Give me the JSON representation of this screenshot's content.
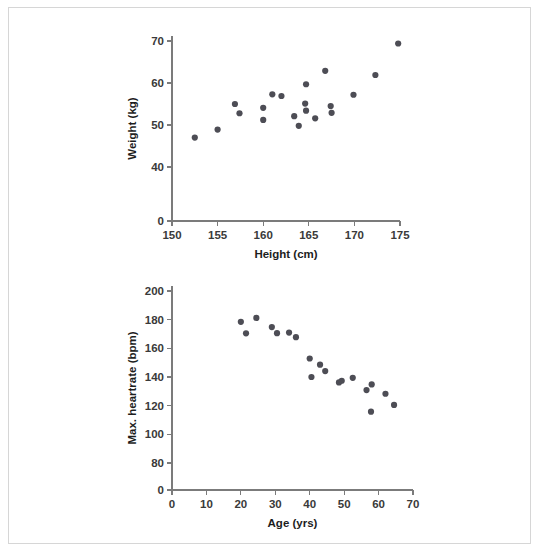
{
  "page": {
    "background": "#ffffff",
    "frame_color": "#d6d6d6",
    "point_color": "#4d4d55",
    "axis_color": "#7b7b7b"
  },
  "chart_data": [
    {
      "id": "height-weight-scatter",
      "type": "scatter",
      "title": "",
      "xlabel": "Height (cm)",
      "ylabel": "Weight (kg)",
      "xlim": [
        150,
        175
      ],
      "ylim": [
        35,
        72
      ],
      "xticks": [
        150,
        155,
        160,
        165,
        170,
        175
      ],
      "yticks": [
        0,
        40,
        50,
        60,
        70
      ],
      "y_axis_broken": true,
      "grid": false,
      "legend": "none",
      "points": [
        {
          "x": 152.5,
          "y": 47.0
        },
        {
          "x": 155.0,
          "y": 48.9
        },
        {
          "x": 156.9,
          "y": 55.0
        },
        {
          "x": 157.4,
          "y": 52.8
        },
        {
          "x": 160.0,
          "y": 54.1
        },
        {
          "x": 160.0,
          "y": 51.2
        },
        {
          "x": 161.0,
          "y": 57.3
        },
        {
          "x": 162.0,
          "y": 56.9
        },
        {
          "x": 163.4,
          "y": 52.1
        },
        {
          "x": 163.9,
          "y": 49.8
        },
        {
          "x": 164.7,
          "y": 59.7
        },
        {
          "x": 164.6,
          "y": 55.1
        },
        {
          "x": 164.7,
          "y": 53.4
        },
        {
          "x": 165.7,
          "y": 51.6
        },
        {
          "x": 166.8,
          "y": 62.9
        },
        {
          "x": 167.4,
          "y": 54.5
        },
        {
          "x": 167.5,
          "y": 52.9
        },
        {
          "x": 169.9,
          "y": 57.2
        },
        {
          "x": 172.3,
          "y": 61.9
        },
        {
          "x": 174.8,
          "y": 69.4
        }
      ]
    },
    {
      "id": "age-heartrate-scatter",
      "type": "scatter",
      "title": "",
      "xlabel": "Age (yrs)",
      "ylabel": "Max. heartrate (bpm)",
      "xlim": [
        0,
        70
      ],
      "ylim": [
        70,
        202
      ],
      "xticks": [
        0,
        10,
        20,
        30,
        40,
        50,
        60,
        70
      ],
      "yticks": [
        0,
        80,
        100,
        120,
        140,
        160,
        180,
        200
      ],
      "y_axis_broken": true,
      "grid": false,
      "legend": "none",
      "points": [
        {
          "x": 20.0,
          "y": 178.5
        },
        {
          "x": 21.5,
          "y": 170.5
        },
        {
          "x": 24.5,
          "y": 181.2
        },
        {
          "x": 29.0,
          "y": 174.8
        },
        {
          "x": 30.5,
          "y": 170.6
        },
        {
          "x": 34.0,
          "y": 171.0
        },
        {
          "x": 36.0,
          "y": 167.8
        },
        {
          "x": 40.0,
          "y": 152.9
        },
        {
          "x": 40.5,
          "y": 140.0
        },
        {
          "x": 43.0,
          "y": 148.6
        },
        {
          "x": 44.5,
          "y": 144.1
        },
        {
          "x": 48.5,
          "y": 136.2
        },
        {
          "x": 49.3,
          "y": 137.4
        },
        {
          "x": 52.5,
          "y": 139.4
        },
        {
          "x": 56.5,
          "y": 130.9
        },
        {
          "x": 58.0,
          "y": 134.8
        },
        {
          "x": 57.8,
          "y": 115.8
        },
        {
          "x": 62.0,
          "y": 128.3
        },
        {
          "x": 64.5,
          "y": 120.5
        }
      ]
    }
  ]
}
